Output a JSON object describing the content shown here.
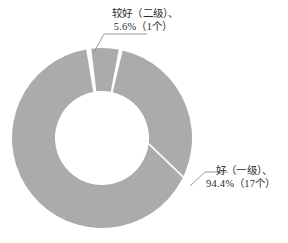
{
  "chart_data": {
    "type": "pie",
    "variant": "donut",
    "title": "",
    "subtitle": "",
    "xlabel": "",
    "ylabel": "",
    "legend_position": "none",
    "grid": false,
    "labels": [
      "好（一级）",
      "较好（二级）"
    ],
    "values": [
      94.4,
      5.6
    ],
    "counts": [
      17,
      1
    ],
    "count_unit": "个",
    "total_count": 18,
    "colors": [
      "#ababab",
      "#ababab"
    ],
    "slice_separator_color": "#ffffff",
    "annotations": [
      {
        "id": "slice-good",
        "label": "好（一级）",
        "percent": "94.4%",
        "count": "17个",
        "line1": "好（一级）、",
        "line2": "94.4%（17个）",
        "value": 94.4,
        "leader": "right"
      },
      {
        "id": "slice-fairly-good",
        "label": "较好（二级）",
        "percent": "5.6%",
        "count": "1个",
        "line1": "较好（二级）、",
        "line2": "5.6%（1个）",
        "value": 5.6,
        "leader": "top"
      }
    ]
  },
  "chart": {
    "background_color": "#ffffff",
    "slice_color": "#ababab",
    "leader_line_color": "#8f8f8f",
    "text_color": "#2b2b2b"
  },
  "callouts": {
    "top": {
      "line1": "较好（二级）、",
      "line2": "5.6%（1个）"
    },
    "bottom": {
      "line1": "好（一级）、",
      "line2": "94.4%（17个）"
    }
  }
}
